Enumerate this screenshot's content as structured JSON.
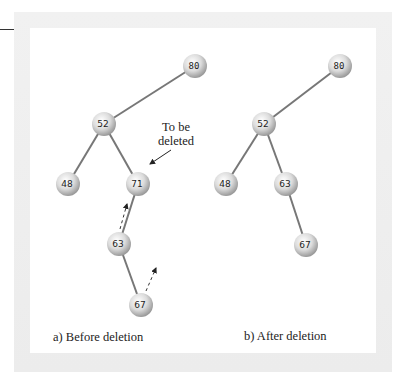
{
  "annotation": {
    "line1": "To be",
    "line2": "deleted"
  },
  "captions": {
    "before": "a) Before deletion",
    "after": "b) After deletion"
  },
  "trees": {
    "before": {
      "nodes": [
        {
          "id": "80",
          "label": "80",
          "x": 195,
          "y": 66,
          "mono": true
        },
        {
          "id": "52",
          "label": "52",
          "x": 104,
          "y": 124
        },
        {
          "id": "48",
          "label": "48",
          "x": 68,
          "y": 184
        },
        {
          "id": "71",
          "label": "71",
          "x": 138,
          "y": 184
        },
        {
          "id": "63",
          "label": "63",
          "x": 119,
          "y": 244
        },
        {
          "id": "67",
          "label": "67",
          "x": 141,
          "y": 305
        }
      ],
      "edges": [
        [
          "80",
          "52"
        ],
        [
          "52",
          "48"
        ],
        [
          "52",
          "71"
        ],
        [
          "71",
          "63"
        ],
        [
          "63",
          "67"
        ]
      ]
    },
    "after": {
      "nodes": [
        {
          "id": "80",
          "label": "80",
          "x": 340,
          "y": 66,
          "mono": true
        },
        {
          "id": "52",
          "label": "52",
          "x": 264,
          "y": 124
        },
        {
          "id": "48",
          "label": "48",
          "x": 226,
          "y": 184
        },
        {
          "id": "63",
          "label": "63",
          "x": 286,
          "y": 184
        },
        {
          "id": "67",
          "label": "67",
          "x": 306,
          "y": 245
        }
      ],
      "edges": [
        [
          "80",
          "52"
        ],
        [
          "52",
          "48"
        ],
        [
          "52",
          "63"
        ],
        [
          "63",
          "67"
        ]
      ]
    }
  },
  "colors": {
    "edge": "#777777",
    "node_light": "#ffffff",
    "node_dark": "#9a9a9a",
    "text": "#222222"
  }
}
